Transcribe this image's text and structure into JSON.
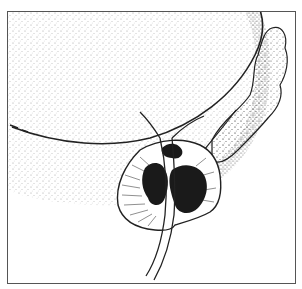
{
  "figure": {
    "type": "anatomical-illustration",
    "style": "black-and-white stippled line drawing",
    "subjects": [
      "bladder",
      "prostate",
      "urethra",
      "seminal-vesicle",
      "tumor-lesions"
    ],
    "colors": {
      "ink": "#222222",
      "lesion": "#1a1a1a",
      "frame": "#555555",
      "background": "#ffffff"
    }
  }
}
